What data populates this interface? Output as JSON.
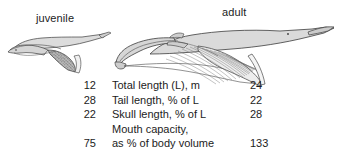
{
  "figure": {
    "labels": {
      "juvenile": "juvenile",
      "adult": "adult"
    },
    "illustration": {
      "juvenile_name": "juvenile-rorqual-whale-diagram",
      "adult_name": "adult-rorqual-whale-diagram"
    }
  },
  "table": {
    "rows": [
      {
        "juvenile": "12",
        "label": "Total length (L), m",
        "label_line2": "",
        "adult": "24"
      },
      {
        "juvenile": "28",
        "label": "Tail length, % of L",
        "label_line2": "",
        "adult": "22"
      },
      {
        "juvenile": "22",
        "label": "Skull length, % of L",
        "label_line2": "",
        "adult": "28"
      },
      {
        "juvenile": "75",
        "label": "Mouth capacity,",
        "label_line2": "as % of body volume",
        "adult": "133"
      }
    ]
  },
  "colors": {
    "ink": "#1c1c1c",
    "outline": "#3a3a3a",
    "body_fill": "#d8d8d8",
    "pouch_fill": "#c6c6c6",
    "background": "#ffffff"
  }
}
